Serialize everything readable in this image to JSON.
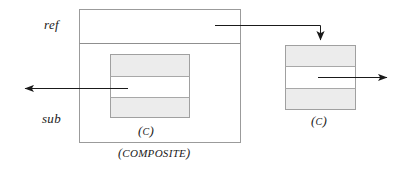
{
  "diagram": {
    "colors": {
      "box_border": "#9a9a9a",
      "box_fill": "#ffffff",
      "band_fill": "#ececec",
      "band_border": "#a8a8a8",
      "arrow": "#1a1a1a",
      "text": "#1a1a1a",
      "background": "#ffffff"
    },
    "labels": {
      "ref": "ref",
      "sub": "sub",
      "inner_c_open": "(",
      "inner_c_letter": "C",
      "inner_c_close": ")",
      "right_c_open": "(",
      "right_c_letter": "C",
      "right_c_close": ")",
      "composite_open": "(",
      "composite_text": "COMPOSITE",
      "composite_close": ")"
    },
    "composite_box": {
      "x": 79,
      "y": 9,
      "width": 162,
      "height": 134,
      "divider_y": 43,
      "ref_band": "ref",
      "sub_band": "sub"
    },
    "inner_box": {
      "x": 110,
      "y": 54,
      "width": 80,
      "height": 64,
      "divider_top_y": 76,
      "divider_bottom_y": 98,
      "bands": [
        "shaded",
        "clear",
        "shaded"
      ]
    },
    "right_box": {
      "x": 285,
      "y": 45,
      "width": 71,
      "height": 65,
      "divider_top_y": 66,
      "divider_bottom_y": 89,
      "bands": [
        "shaded",
        "clear",
        "shaded"
      ]
    },
    "arrows": [
      {
        "name": "ref-to-right-box",
        "from": "composite ref band",
        "to": "right box top",
        "direction": "down",
        "path": "M 215 25 H 320 V 41"
      },
      {
        "name": "inner-box-outgoing-left",
        "from": "inner box clear band",
        "to": "left of diagram",
        "direction": "left",
        "path": "M 128 88 H 22"
      },
      {
        "name": "right-box-outgoing-right",
        "from": "right box clear band",
        "to": "right of diagram",
        "direction": "right",
        "path": "M 318 77 H 390"
      }
    ]
  }
}
